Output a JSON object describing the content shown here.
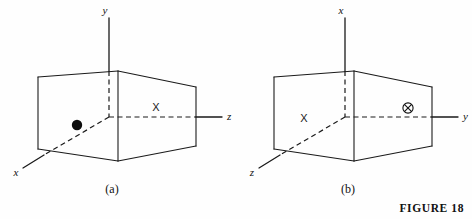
{
  "figure": {
    "caption": "FIGURE 18",
    "background_color": "#fefefe",
    "line_color": "#1a1a1a"
  },
  "panels": [
    {
      "id": "a",
      "caption": "(a)",
      "axes": [
        {
          "name": "vertical-axis",
          "label": "y",
          "direction": "up"
        },
        {
          "name": "horizontal-axis",
          "label": "z",
          "direction": "right"
        },
        {
          "name": "depth-axis",
          "label": "x",
          "direction": "lower-left"
        }
      ],
      "markers": [
        {
          "name": "filled-dot",
          "glyph": "●",
          "label": "",
          "position": "front-left-interior"
        },
        {
          "name": "x-marker",
          "glyph": "X",
          "label": "X",
          "position": "right-of-origin-above-axis"
        }
      ]
    },
    {
      "id": "b",
      "caption": "(b)",
      "axes": [
        {
          "name": "vertical-axis",
          "label": "x",
          "direction": "up"
        },
        {
          "name": "horizontal-axis",
          "label": "y",
          "direction": "right"
        },
        {
          "name": "depth-axis",
          "label": "z",
          "direction": "lower-left"
        }
      ],
      "markers": [
        {
          "name": "x-marker",
          "glyph": "X",
          "label": "X",
          "position": "left-of-origin-interior"
        },
        {
          "name": "circled-plus-marker",
          "glyph": "⊕",
          "label": "",
          "position": "right-of-origin-above-axis"
        }
      ]
    }
  ]
}
